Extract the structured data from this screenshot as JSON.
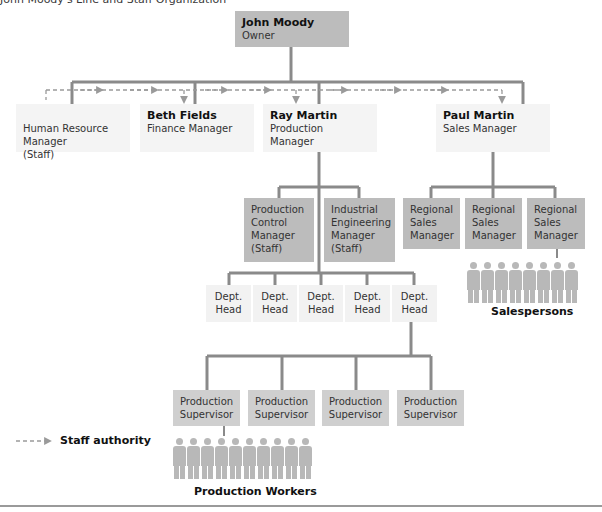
{
  "title": "John Moody's Line and Staff Organization",
  "owner": {
    "name": "John Moody",
    "role": "Owner"
  },
  "top_row": [
    {
      "name": "",
      "role": "Human Resource\nManager\n(Staff)"
    },
    {
      "name": "Beth Fields",
      "role": "Finance Manager"
    },
    {
      "name": "Ray Martin",
      "role": "Production Manager"
    },
    {
      "name": "Paul Martin",
      "role": "Sales Manager"
    }
  ],
  "staff_managers": [
    {
      "role": "Production\nControl\nManager\n(Staff)"
    },
    {
      "role": "Industrial\nEngineering\nManager\n(Staff)"
    }
  ],
  "regional_managers": [
    {
      "role": "Regional\nSales\nManager"
    },
    {
      "role": "Regional\nSales\nManager"
    },
    {
      "role": "Regional\nSales\nManager"
    }
  ],
  "dept_heads": [
    {
      "role": "Dept.\nHead"
    },
    {
      "role": "Dept.\nHead"
    },
    {
      "role": "Dept.\nHead"
    },
    {
      "role": "Dept.\nHead"
    },
    {
      "role": "Dept.\nHead"
    }
  ],
  "supervisors": [
    {
      "role": "Production\nSupervisor"
    },
    {
      "role": "Production\nSupervisor"
    },
    {
      "role": "Production\nSupervisor"
    },
    {
      "role": "Production\nSupervisor"
    }
  ],
  "salespersons": {
    "label": "Salespersons",
    "count": 8
  },
  "workers": {
    "label": "Production Workers",
    "count": 10
  },
  "legend": {
    "label": "Staff authority"
  },
  "colors": {
    "line": "#8a8a8a",
    "dashed": "#9a9a9a",
    "dark_box": "#bcbcbc",
    "light_box": "#f2f2f2",
    "mid_box": "#cfcfcf"
  }
}
